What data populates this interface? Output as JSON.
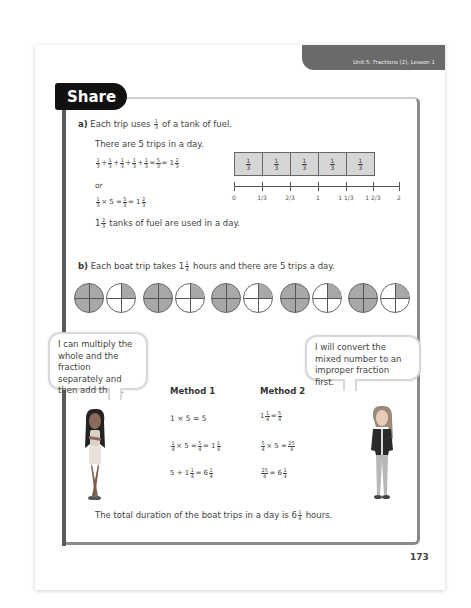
{
  "header": {
    "unit_label": "Unit 5: Fractions (2), Lesson 1"
  },
  "section": {
    "title": "Share"
  },
  "part_a": {
    "label": "a)",
    "question_pre": "Each trip uses",
    "question_frac": {
      "n": "1",
      "d": "3"
    },
    "question_post": "of a tank of fuel.",
    "trips_line": "There are 5 trips in a day.",
    "eq1": "1/3 + 1/3 + 1/3 + 1/3 + 1/3 = 5/3 = 1 2/3",
    "or_label": "or",
    "eq2": "1/3 × 5 = 5/3 = 1 2/3",
    "conclusion_whole": "1",
    "conclusion_frac": {
      "n": "2",
      "d": "3"
    },
    "conclusion_post": "tanks of fuel are used in a day.",
    "bar_model": {
      "cells": [
        {
          "n": "1",
          "d": "3"
        },
        {
          "n": "1",
          "d": "3"
        },
        {
          "n": "1",
          "d": "3"
        },
        {
          "n": "1",
          "d": "3"
        },
        {
          "n": "1",
          "d": "3"
        }
      ]
    },
    "number_line": {
      "ticks": [
        "0",
        "1/3",
        "2/3",
        "1",
        "1 1/3",
        "1 2/3",
        "2"
      ]
    }
  },
  "part_b": {
    "label": "b)",
    "question_pre": "Each boat trip takes",
    "question_whole": "1",
    "question_frac": {
      "n": "1",
      "d": "4"
    },
    "question_post": "hours and there are 5 trips a day.",
    "clocks": [
      "full",
      "quarter",
      "full",
      "quarter",
      "full",
      "quarter",
      "full",
      "quarter",
      "full",
      "quarter"
    ]
  },
  "speech": {
    "left": "I can multiply the whole and the fraction separately and then add them.",
    "right": "I will convert the mixed number to an improper fraction first."
  },
  "methods": {
    "method1": {
      "title": "Method 1",
      "lines": [
        "1 × 5 = 5",
        "1/4 × 5 = 5/4 = 1 1/4",
        "5 + 1 1/4 = 6 1/4"
      ]
    },
    "method2": {
      "title": "Method 2",
      "lines": [
        "1 1/4 = 5/4",
        "5/4 × 5 = 25/4",
        "25/4 = 6 1/4"
      ]
    }
  },
  "conclusion": {
    "pre": "The total duration of the boat trips in a day is 6",
    "frac": {
      "n": "1",
      "d": "4"
    },
    "post": "hours."
  },
  "footer": {
    "page_number": "173"
  }
}
